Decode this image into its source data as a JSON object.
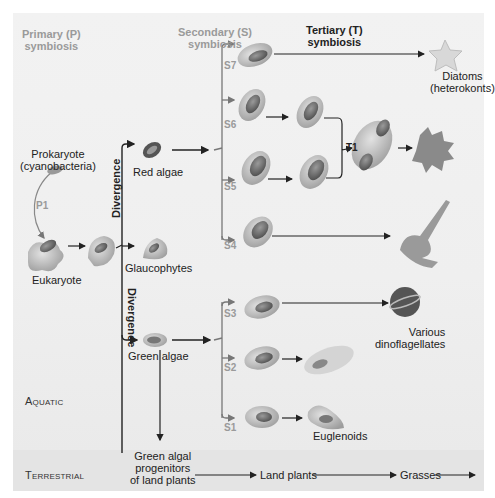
{
  "headers": {
    "primary": [
      "Primary (P)",
      "symbiosis"
    ],
    "secondary": [
      "Secondary (S)",
      "symbiosis"
    ],
    "tertiary": [
      "Tertiary (T)",
      "symbiosis"
    ]
  },
  "nodes": {
    "prokaryote": [
      "Prokaryote",
      "(cyanobacteria)"
    ],
    "eukaryote": "Eukaryote",
    "red_algae": "Red algae",
    "glaucophytes": "Glaucophytes",
    "green_algae": "Green algae",
    "diatoms": [
      "Diatoms",
      "(heterokonts)"
    ],
    "dinoflagellates": [
      "Various",
      "dinoflagellates"
    ],
    "euglenoids": "Euglenoids",
    "green_algal_progenitors": [
      "Green algal",
      "progenitors",
      "of land plants"
    ],
    "land_plants": "Land plants",
    "grasses": "Grasses"
  },
  "event_labels": {
    "p1": "P1",
    "t1": "T1",
    "s1": "S1",
    "s2": "S2",
    "s3": "S3",
    "s4": "S4",
    "s5": "S5",
    "s6": "S6",
    "s7": "S7"
  },
  "divergence_labels": [
    "Divergence",
    "Divergence"
  ],
  "zones": {
    "aquatic": "Aquatic",
    "terrestrial": "Terrestrial"
  },
  "colors": {
    "background": "#efefef",
    "terrestrial_band": "#e4e4e4",
    "arrow": "#222222",
    "gray_label": "#9a9a9a",
    "cell_body": "#b9b9b9",
    "plastid": "#6e6e6e"
  }
}
